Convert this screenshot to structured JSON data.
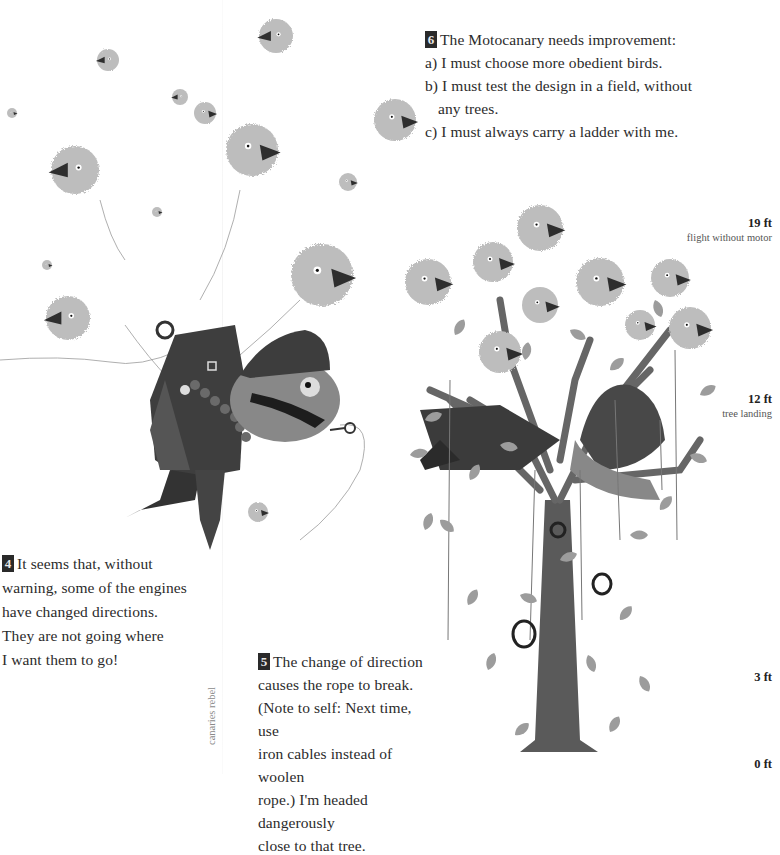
{
  "page": {
    "style": "grayscale picture-book spread",
    "colors": {
      "background": "#ffffff",
      "text": "#2b2b2b",
      "badge_bg": "#2a2a2a",
      "badge_fg": "#e8e8e8",
      "bird_fluff": "#b8b8b8",
      "beak": "#2e2e2e",
      "trunk": "#5a5a5a",
      "leaf": "#9a9a9a"
    }
  },
  "captions": {
    "step6": {
      "number": "6",
      "lines": [
        "The Motocanary needs improvement:",
        "a) I must choose more obedient birds.",
        "b) I must test the design in a field, without",
        "any trees.",
        "c) I must always carry a ladder with me."
      ]
    },
    "step4": {
      "number": "4",
      "lines": [
        "It seems that, without",
        "warning, some of the engines",
        "have changed directions.",
        "They are not going where",
        "I want them to go!"
      ]
    },
    "step5": {
      "number": "5",
      "lines": [
        "The change of direction",
        "causes the rope to break.",
        "(Note to self: Next time, use",
        "iron cables instead of woolen",
        "rope.) I'm headed dangerously",
        "close to that tree."
      ]
    }
  },
  "height_scale": [
    {
      "value": "19 ft",
      "caption": "flight without motor"
    },
    {
      "value": "12 ft",
      "caption": "tree landing"
    },
    {
      "value": "3 ft",
      "caption": ""
    },
    {
      "value": "0 ft",
      "caption": ""
    }
  ],
  "credit": "canaries rebel",
  "illustration": {
    "icons": [
      "canary-bird-icon",
      "pilot-character-icon",
      "tree-icon",
      "leaf-icon",
      "ring-icon"
    ]
  }
}
